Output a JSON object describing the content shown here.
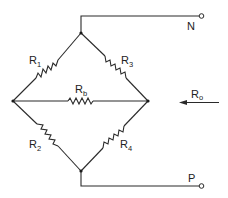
{
  "diagram": {
    "type": "wheatstone-bridge-circuit",
    "labels": {
      "r1": {
        "main": "R",
        "sub": "1"
      },
      "r2": {
        "main": "R",
        "sub": "2"
      },
      "r3": {
        "main": "R",
        "sub": "3"
      },
      "r4": {
        "main": "R",
        "sub": "4"
      },
      "rb": {
        "main": "R",
        "sub": "b"
      },
      "r0": {
        "main": "R",
        "sub": "o"
      },
      "terminal_top": "N",
      "terminal_bottom": "P"
    },
    "colors": {
      "line": "#2a2a2a",
      "background": "#ffffff"
    }
  }
}
